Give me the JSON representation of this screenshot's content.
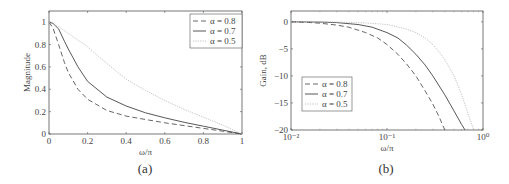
{
  "chart_data": [
    {
      "id": "a",
      "type": "line",
      "caption": "(a)",
      "title": "",
      "xlabel": "ω/π",
      "ylabel": "Magnitude",
      "xlim": [
        0,
        1
      ],
      "ylim": [
        0,
        1.1
      ],
      "xscale": "linear",
      "xticks": [
        0,
        0.2,
        0.4,
        0.6,
        0.8,
        1
      ],
      "xtick_labels": [
        "0",
        "0.2",
        "0.4",
        "0.6",
        "0.8",
        "1"
      ],
      "yticks": [
        0,
        0.2,
        0.4,
        0.6,
        0.8,
        1
      ],
      "ytick_labels": [
        "0",
        "0.2",
        "0.4",
        "0.6",
        "0.8",
        "1"
      ],
      "grid": false,
      "legend_position": "upper right",
      "series": [
        {
          "name": "α = 0.8",
          "style": "dashed",
          "x": [
            0,
            0.02,
            0.05,
            0.08,
            0.1,
            0.15,
            0.2,
            0.3,
            0.4,
            0.5,
            0.6,
            0.7,
            0.8,
            0.9,
            1.0
          ],
          "y": [
            1.0,
            0.95,
            0.8,
            0.64,
            0.55,
            0.4,
            0.31,
            0.21,
            0.16,
            0.13,
            0.1,
            0.075,
            0.05,
            0.025,
            0.0
          ]
        },
        {
          "name": "α = 0.7",
          "style": "solid",
          "x": [
            0,
            0.02,
            0.05,
            0.08,
            0.1,
            0.15,
            0.2,
            0.3,
            0.4,
            0.5,
            0.6,
            0.7,
            0.8,
            0.9,
            1.0
          ],
          "y": [
            1.0,
            0.99,
            0.94,
            0.83,
            0.76,
            0.6,
            0.47,
            0.33,
            0.25,
            0.19,
            0.145,
            0.105,
            0.07,
            0.035,
            0.0
          ]
        },
        {
          "name": "α = 0.5",
          "style": "dotted",
          "x": [
            0,
            0.05,
            0.1,
            0.15,
            0.2,
            0.3,
            0.4,
            0.5,
            0.6,
            0.7,
            0.8,
            0.9,
            1.0
          ],
          "y": [
            1.0,
            0.96,
            0.9,
            0.84,
            0.78,
            0.63,
            0.49,
            0.39,
            0.3,
            0.22,
            0.15,
            0.08,
            0.0
          ]
        }
      ]
    },
    {
      "id": "b",
      "type": "line",
      "caption": "(b)",
      "title": "",
      "xlabel": "ω/π",
      "ylabel": "Gain, dB",
      "xlim": [
        0.01,
        1
      ],
      "ylim": [
        -20,
        2
      ],
      "xscale": "log",
      "xticks": [
        0.01,
        0.1,
        1
      ],
      "xtick_labels": [
        "10⁻²",
        "10⁻¹",
        "10⁰"
      ],
      "yticks": [
        -20,
        -15,
        -10,
        -5,
        0
      ],
      "ytick_labels": [
        "−20",
        "−15",
        "−10",
        "−5",
        "0"
      ],
      "grid": false,
      "legend_position": "lower left",
      "series": [
        {
          "name": "α = 0.8",
          "style": "dashed",
          "x": [
            0.01,
            0.015,
            0.02,
            0.03,
            0.04,
            0.06,
            0.08,
            0.1,
            0.13,
            0.16,
            0.2,
            0.25,
            0.3,
            0.35,
            0.4
          ],
          "y": [
            0,
            -0.1,
            -0.25,
            -0.6,
            -1.0,
            -2.0,
            -3.0,
            -4.2,
            -6.0,
            -7.8,
            -10.0,
            -12.8,
            -15.2,
            -17.6,
            -20.0
          ]
        },
        {
          "name": "α = 0.7",
          "style": "solid",
          "x": [
            0.01,
            0.02,
            0.03,
            0.05,
            0.07,
            0.1,
            0.13,
            0.16,
            0.2,
            0.25,
            0.3,
            0.4,
            0.5,
            0.6,
            0.65
          ],
          "y": [
            0,
            -0.05,
            -0.15,
            -0.5,
            -1.0,
            -2.0,
            -3.0,
            -4.3,
            -6.0,
            -8.0,
            -10.0,
            -13.5,
            -16.5,
            -19.0,
            -20.0
          ]
        },
        {
          "name": "α = 0.5",
          "style": "dotted",
          "x": [
            0.01,
            0.03,
            0.06,
            0.1,
            0.15,
            0.2,
            0.25,
            0.3,
            0.35,
            0.4,
            0.5,
            0.6,
            0.7,
            0.8
          ],
          "y": [
            0,
            -0.05,
            -0.2,
            -0.5,
            -1.2,
            -2.0,
            -3.0,
            -4.2,
            -5.6,
            -7.0,
            -10.0,
            -13.5,
            -17.0,
            -20.0
          ]
        }
      ]
    }
  ]
}
